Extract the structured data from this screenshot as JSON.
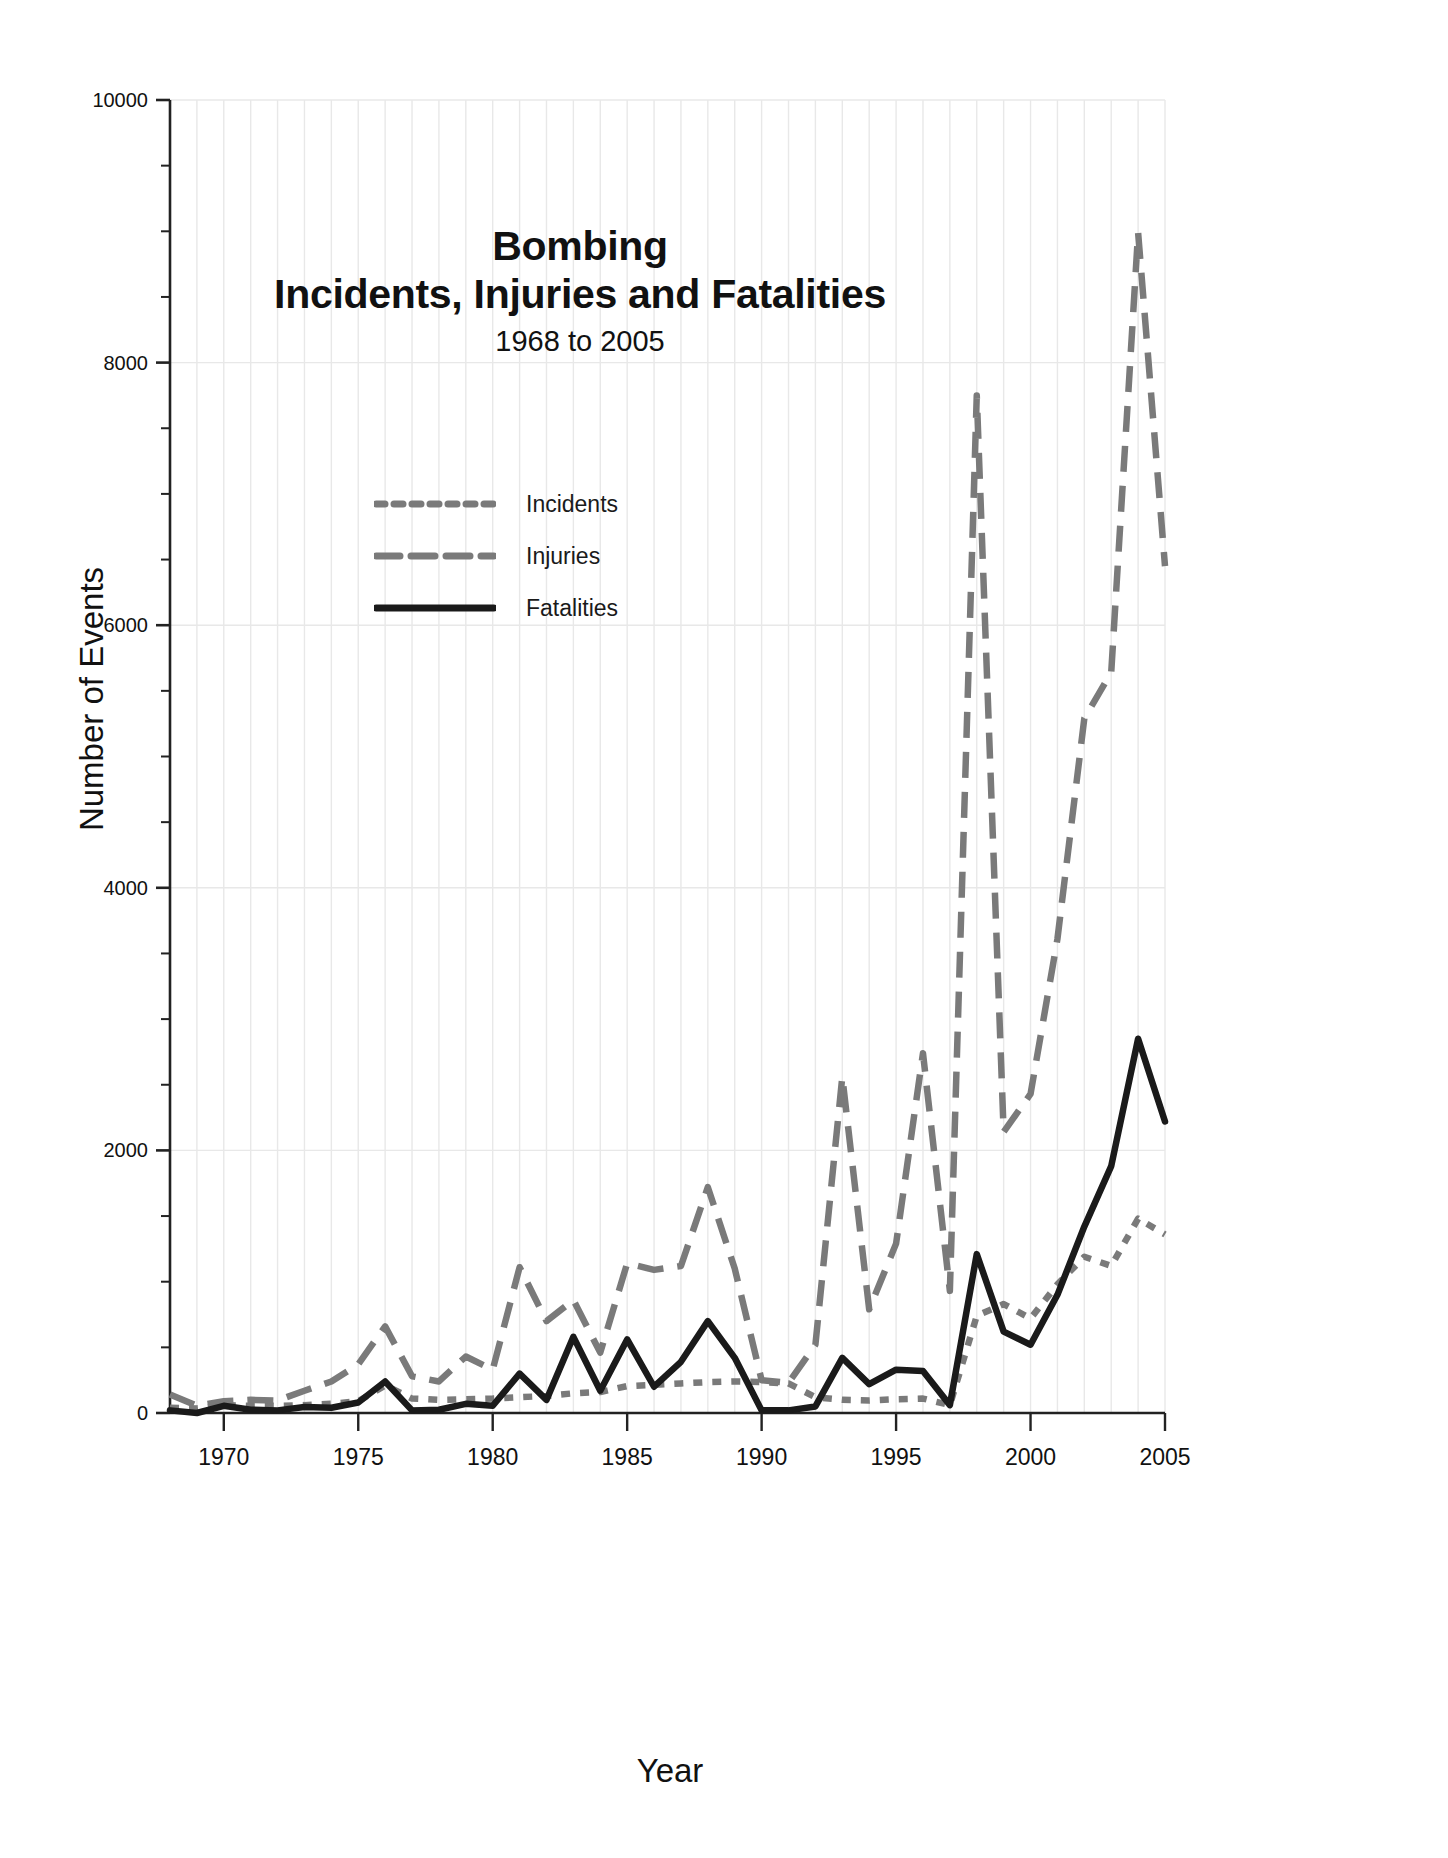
{
  "chart_data": {
    "type": "line",
    "title": "Bombing\nIncidents, Injuries and Fatalities",
    "title_line1": "Bombing",
    "title_line2": "Incidents, Injuries and Fatalities",
    "subtitle": "1968 to 2005",
    "xlabel": "Year",
    "ylabel": "Number of Events",
    "xlim": [
      1968,
      2005
    ],
    "ylim": [
      0,
      10000
    ],
    "ytick_labels": [
      "0",
      "2000",
      "4000",
      "6000",
      "8000",
      "10000"
    ],
    "ytick_values": [
      0,
      2000,
      4000,
      6000,
      8000,
      10000
    ],
    "yminor_step": 500,
    "xtick_labels": [
      "1970",
      "1975",
      "1980",
      "1985",
      "1990",
      "1995",
      "2000",
      "2005"
    ],
    "xtick_values": [
      1970,
      1975,
      1980,
      1985,
      1990,
      1995,
      2000,
      2005
    ],
    "grid": "vertical-minor-and-horizontal-major",
    "legend_position": "upper-left-inside",
    "colors": {
      "incidents": "#7a7a7a",
      "injuries": "#7a7a7a",
      "fatalities": "#1a1a1a",
      "grid": "#e8e8e8",
      "axis": "#222222",
      "background": "#ffffff"
    },
    "x": [
      1968,
      1969,
      1970,
      1971,
      1972,
      1973,
      1974,
      1975,
      1976,
      1977,
      1978,
      1979,
      1980,
      1981,
      1982,
      1983,
      1984,
      1985,
      1986,
      1987,
      1988,
      1989,
      1990,
      1991,
      1992,
      1993,
      1994,
      1995,
      1996,
      1997,
      1998,
      1999,
      2000,
      2001,
      2002,
      2003,
      2004,
      2005
    ],
    "series": [
      {
        "name": "Incidents",
        "style": "dotted",
        "color": "#7a7a7a",
        "values": [
          40,
          35,
          60,
          55,
          55,
          60,
          70,
          90,
          210,
          110,
          100,
          105,
          110,
          120,
          130,
          150,
          160,
          205,
          215,
          225,
          235,
          240,
          235,
          225,
          120,
          100,
          95,
          105,
          110,
          60,
          740,
          830,
          720,
          980,
          1190,
          1120,
          1480,
          1360
        ]
      },
      {
        "name": "Injuries",
        "style": "dashed",
        "color": "#7a7a7a",
        "values": [
          140,
          55,
          90,
          100,
          95,
          170,
          240,
          370,
          660,
          280,
          240,
          430,
          330,
          1110,
          700,
          860,
          460,
          1140,
          1090,
          1120,
          1720,
          1100,
          250,
          230,
          520,
          2560,
          790,
          1290,
          2740,
          930,
          7750,
          2140,
          2430,
          3610,
          5290,
          5640,
          8990,
          6450
        ]
      },
      {
        "name": "Fatalities",
        "style": "solid",
        "color": "#1a1a1a",
        "values": [
          20,
          0,
          55,
          25,
          20,
          45,
          40,
          80,
          240,
          20,
          25,
          70,
          55,
          300,
          100,
          580,
          170,
          560,
          200,
          390,
          700,
          420,
          20,
          20,
          50,
          420,
          220,
          330,
          320,
          60,
          1210,
          620,
          520,
          900,
          1420,
          1880,
          2850,
          2220
        ]
      }
    ]
  }
}
